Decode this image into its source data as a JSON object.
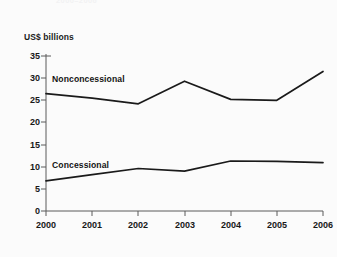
{
  "figure": {
    "clipped_heading": "2000–2006",
    "axis_unit_title": "US$ billions",
    "background_color": "#fbfbfb",
    "line_color": "#1a1a1a",
    "axis_color": "#555555"
  },
  "chart_data": {
    "type": "line",
    "title": "US$ billions",
    "xlabel": "",
    "ylabel": "US$ billions",
    "x": [
      "2000",
      "2001",
      "2002",
      "2003",
      "2004",
      "2005",
      "2006"
    ],
    "categories": [
      "2000",
      "2001",
      "2002",
      "2003",
      "2004",
      "2005",
      "2006"
    ],
    "series": [
      {
        "name": "Nonconcessional",
        "values": [
          26.5,
          25.5,
          24.2,
          29.3,
          25.2,
          25.0,
          31.5
        ]
      },
      {
        "name": "Concessional",
        "values": [
          6.8,
          8.2,
          9.6,
          9.0,
          11.3,
          11.2,
          10.9
        ]
      }
    ],
    "ylim": [
      0,
      35
    ],
    "yticks": [
      0,
      5,
      10,
      15,
      20,
      25,
      30,
      35
    ],
    "ytick_labels": [
      "0",
      "5",
      "10",
      "15",
      "20",
      "25",
      "30",
      "35"
    ],
    "xtick_labels": [
      "2000",
      "2001",
      "2002",
      "2003",
      "2004",
      "2005",
      "2006"
    ],
    "grid": false,
    "legend": "inline-annotations",
    "annotations": [
      {
        "text": "Nonconcessional",
        "series": "Nonconcessional"
      },
      {
        "text": "Concessional",
        "series": "Concessional"
      }
    ]
  }
}
